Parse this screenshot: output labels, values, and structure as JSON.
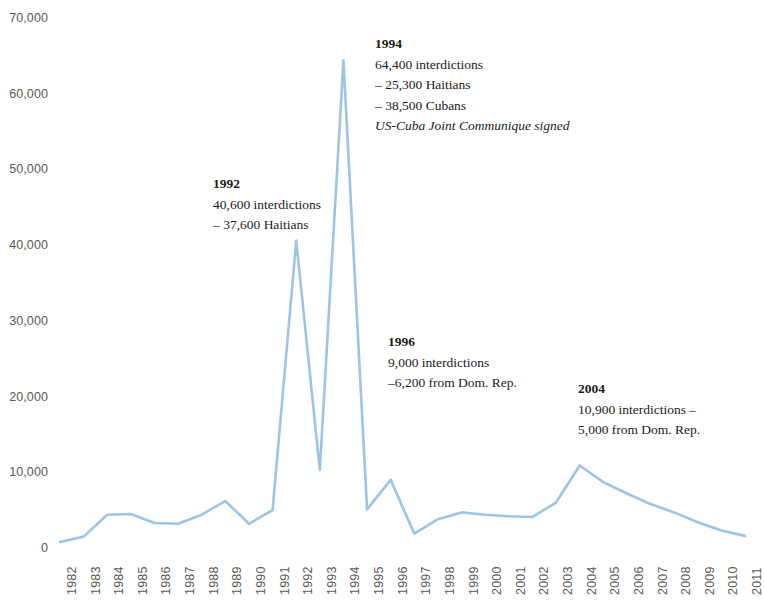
{
  "chart_data": {
    "type": "line",
    "title": "",
    "subtitle": "",
    "xlabel": "",
    "ylabel": "",
    "grid": false,
    "legend": "none",
    "line_color": "#9DC3E6",
    "axis_label_color": "#595959",
    "xlim": [
      1982,
      2011
    ],
    "ylim": [
      0,
      70000
    ],
    "y_ticks": [
      0,
      10000,
      20000,
      30000,
      40000,
      50000,
      60000,
      70000
    ],
    "y_tick_labels": [
      "0",
      "10,000",
      "20,000",
      "30,000",
      "40,000",
      "50,000",
      "60,000",
      "70,000"
    ],
    "categories": [
      "1982",
      "1983",
      "1984",
      "1985",
      "1986",
      "1987",
      "1988",
      "1989",
      "1990",
      "1991",
      "1992",
      "1993",
      "1994",
      "1995",
      "1996",
      "1997",
      "1998",
      "1999",
      "2000",
      "2001",
      "2002",
      "2003",
      "2004",
      "2005",
      "2006",
      "2007",
      "2008",
      "2009",
      "2010",
      "2011"
    ],
    "values": [
      800,
      1500,
      4400,
      4500,
      3300,
      3200,
      4400,
      6200,
      3200,
      5000,
      40600,
      10300,
      64400,
      5100,
      9000,
      1900,
      3800,
      4700,
      4400,
      4200,
      4100,
      6000,
      10900,
      8700,
      7200,
      5800,
      4700,
      3400,
      2300,
      1600
    ],
    "annotations": [
      {
        "id": "ann-1992",
        "year": "1992",
        "lines": [
          "40,600 interdictions",
          "– 37,600 Haitians"
        ],
        "note": ""
      },
      {
        "id": "ann-1994",
        "year": "1994",
        "lines": [
          "64,400 interdictions",
          "– 25,300 Haitians",
          "– 38,500 Cubans"
        ],
        "note": "US-Cuba Joint Communique signed"
      },
      {
        "id": "ann-1996",
        "year": "1996",
        "lines": [
          "9,000 interdictions",
          "–6,200 from Dom. Rep."
        ],
        "note": ""
      },
      {
        "id": "ann-2004",
        "year": "2004",
        "lines": [
          "10,900 interdictions –",
          "5,000 from Dom. Rep."
        ],
        "note": ""
      }
    ]
  }
}
